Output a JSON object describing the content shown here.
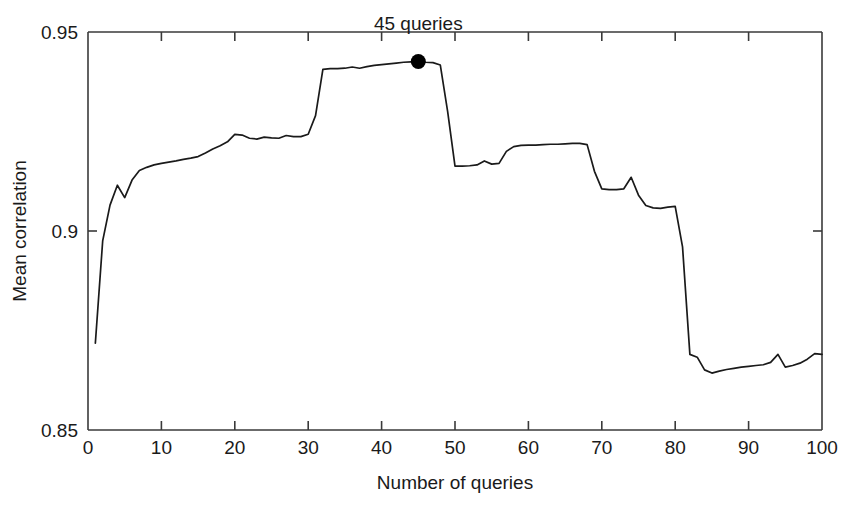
{
  "chart_data": {
    "type": "line",
    "title": "",
    "xlabel": "Number of queries",
    "ylabel": "Mean correlation",
    "xlim": [
      0,
      100
    ],
    "ylim": [
      0.85,
      0.95
    ],
    "xticks": [
      0,
      10,
      20,
      30,
      40,
      50,
      60,
      70,
      80,
      90,
      100
    ],
    "xtick_labels": [
      "0",
      "10",
      "20",
      "30",
      "40",
      "50",
      "60",
      "70",
      "80",
      "90",
      "100"
    ],
    "yticks": [
      0.85,
      0.9,
      0.95
    ],
    "ytick_labels": [
      "0.85",
      "0.9",
      "0.95"
    ],
    "grid": false,
    "legend": "none",
    "line_color": "#1a1a1a",
    "marker_color": "#000000",
    "annotations": [
      {
        "text": "45 queries",
        "x": 45,
        "y": 0.9426,
        "marker": true,
        "label_dx": 0,
        "label_dy": 0.0055
      }
    ],
    "x": [
      1,
      2,
      3,
      4,
      5,
      6,
      7,
      8,
      9,
      10,
      11,
      12,
      13,
      14,
      15,
      16,
      17,
      18,
      19,
      20,
      21,
      22,
      23,
      24,
      25,
      26,
      27,
      28,
      29,
      30,
      31,
      32,
      33,
      34,
      35,
      36,
      37,
      38,
      39,
      40,
      41,
      42,
      43,
      44,
      45,
      46,
      47,
      48,
      49,
      50,
      51,
      52,
      53,
      54,
      55,
      56,
      57,
      58,
      59,
      60,
      61,
      62,
      63,
      64,
      65,
      66,
      67,
      68,
      69,
      70,
      71,
      72,
      73,
      74,
      75,
      76,
      77,
      78,
      79,
      80,
      81,
      82,
      83,
      84,
      85,
      86,
      87,
      88,
      89,
      90,
      91,
      92,
      93,
      94,
      95,
      96,
      97,
      98,
      99,
      100
    ],
    "y": [
      0.8718,
      0.8975,
      0.9065,
      0.9115,
      0.9084,
      0.9128,
      0.9152,
      0.916,
      0.9166,
      0.917,
      0.9173,
      0.9176,
      0.918,
      0.9183,
      0.9187,
      0.9196,
      0.9206,
      0.9214,
      0.9224,
      0.9243,
      0.9241,
      0.9233,
      0.9231,
      0.9236,
      0.9234,
      0.9233,
      0.924,
      0.9237,
      0.9237,
      0.9243,
      0.929,
      0.9406,
      0.9408,
      0.9408,
      0.9409,
      0.9412,
      0.9409,
      0.9413,
      0.9416,
      0.9418,
      0.942,
      0.9422,
      0.9424,
      0.9425,
      0.9426,
      0.9424,
      0.9423,
      0.9417,
      0.93,
      0.9163,
      0.9163,
      0.9164,
      0.9166,
      0.9176,
      0.9168,
      0.917,
      0.92,
      0.9212,
      0.9215,
      0.9216,
      0.9216,
      0.9217,
      0.9218,
      0.9218,
      0.9219,
      0.922,
      0.922,
      0.9217,
      0.915,
      0.9106,
      0.9104,
      0.9104,
      0.9106,
      0.9135,
      0.909,
      0.9064,
      0.9058,
      0.9057,
      0.906,
      0.9062,
      0.896,
      0.869,
      0.8683,
      0.8651,
      0.8643,
      0.8648,
      0.8652,
      0.8655,
      0.8658,
      0.866,
      0.8662,
      0.8664,
      0.867,
      0.869,
      0.8658,
      0.8662,
      0.8668,
      0.8678,
      0.8692,
      0.869,
      0.8675
    ]
  },
  "figure": {
    "plot_left_px": 88,
    "plot_right_px": 822,
    "plot_top_px": 32,
    "plot_bottom_px": 430
  }
}
